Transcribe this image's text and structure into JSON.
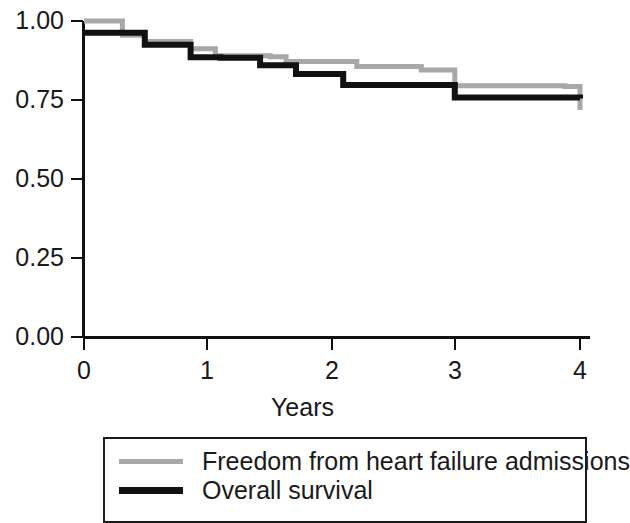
{
  "chart_data": {
    "type": "line",
    "title": "",
    "subtitle": "",
    "xlabel": "Years",
    "ylabel": "",
    "xlim": [
      0,
      4
    ],
    "ylim": [
      0,
      1.0
    ],
    "xticks": [
      "0",
      "1",
      "2",
      "3",
      "4"
    ],
    "xtick_values": [
      0,
      1,
      2,
      3,
      4
    ],
    "yticks": [
      "0.00",
      "0.25",
      "0.50",
      "0.75",
      "1.00"
    ],
    "ytick_values": [
      0.0,
      0.25,
      0.5,
      0.75,
      1.0
    ],
    "grid": false,
    "legend_position": "below-axes",
    "step_type": "post",
    "series": [
      {
        "name": "Freedom from heart failure admissions",
        "color": "#a8a8a8",
        "linewidth": 5,
        "x": [
          0.0,
          0.31,
          0.49,
          0.86,
          1.06,
          1.5,
          1.63,
          2.2,
          2.72,
          2.99,
          3.88,
          4.0
        ],
        "y": [
          1.0,
          0.955,
          0.935,
          0.912,
          0.89,
          0.887,
          0.872,
          0.856,
          0.845,
          0.795,
          0.793,
          0.718
        ]
      },
      {
        "name": "Overall survival",
        "color": "#111111",
        "linewidth": 6,
        "x": [
          0.0,
          0.49,
          0.86,
          1.1,
          1.42,
          1.71,
          2.09,
          2.99,
          4.0
        ],
        "y": [
          0.963,
          0.925,
          0.885,
          0.884,
          0.86,
          0.832,
          0.797,
          0.758,
          0.755
        ]
      }
    ],
    "legend_entries": [
      {
        "label": "Freedom from heart failure admissions",
        "color": "#a8a8a8",
        "style": "gray-line"
      },
      {
        "label": "Overall survival",
        "color": "#111111",
        "style": "black-line"
      }
    ]
  },
  "axes": {
    "axis_color": "#111111",
    "background": "#ffffff"
  }
}
